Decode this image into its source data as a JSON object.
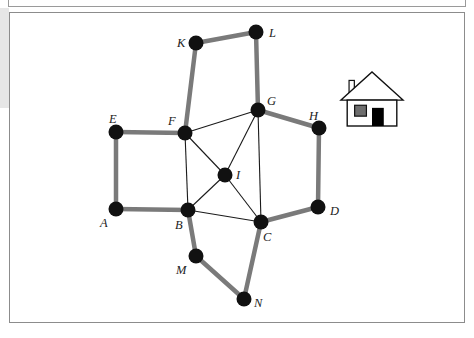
{
  "figure": {
    "background_color": "#ffffff",
    "frame_border_color": "#8c8c8c",
    "node_color": "#111111",
    "thick_edge_color": "#7a7a7a",
    "thin_edge_color": "#1a1a1a",
    "node_radius": 7.5,
    "thick_edge_width": 4.5,
    "thin_edge_width": 1.1
  },
  "graph": {
    "nodes": [
      {
        "id": "A",
        "label": "A",
        "x": 116,
        "y": 209,
        "label_x": 100,
        "label_y": 217
      },
      {
        "id": "B",
        "label": "B",
        "x": 188,
        "y": 210,
        "label_x": 175,
        "label_y": 219
      },
      {
        "id": "C",
        "label": "C",
        "x": 261,
        "y": 222,
        "label_x": 263,
        "label_y": 231
      },
      {
        "id": "D",
        "label": "D",
        "x": 318,
        "y": 207,
        "label_x": 330,
        "label_y": 205
      },
      {
        "id": "E",
        "label": "E",
        "x": 116,
        "y": 132,
        "label_x": 109,
        "label_y": 113
      },
      {
        "id": "F",
        "label": "F",
        "x": 185,
        "y": 133,
        "label_x": 168,
        "label_y": 115
      },
      {
        "id": "G",
        "label": "G",
        "x": 258,
        "y": 110,
        "label_x": 267,
        "label_y": 95
      },
      {
        "id": "H",
        "label": "H",
        "x": 319,
        "y": 128,
        "label_x": 309,
        "label_y": 110
      },
      {
        "id": "I",
        "label": "I",
        "x": 225,
        "y": 175,
        "label_x": 236,
        "label_y": 169
      },
      {
        "id": "K",
        "label": "K",
        "x": 196,
        "y": 43,
        "label_x": 177,
        "label_y": 37
      },
      {
        "id": "L",
        "label": "L",
        "x": 256,
        "y": 32,
        "label_x": 269,
        "label_y": 27
      },
      {
        "id": "M",
        "label": "M",
        "x": 196,
        "y": 256,
        "label_x": 176,
        "label_y": 264
      },
      {
        "id": "N",
        "label": "N",
        "x": 244,
        "y": 299,
        "label_x": 254,
        "label_y": 297
      }
    ],
    "edges_thick": [
      {
        "from": "E",
        "to": "F"
      },
      {
        "from": "E",
        "to": "A"
      },
      {
        "from": "A",
        "to": "B"
      },
      {
        "from": "F",
        "to": "K"
      },
      {
        "from": "K",
        "to": "L"
      },
      {
        "from": "L",
        "to": "G"
      },
      {
        "from": "G",
        "to": "H"
      },
      {
        "from": "H",
        "to": "D"
      },
      {
        "from": "D",
        "to": "C"
      },
      {
        "from": "B",
        "to": "M"
      },
      {
        "from": "M",
        "to": "N"
      },
      {
        "from": "N",
        "to": "C"
      }
    ],
    "edges_thin": [
      {
        "from": "F",
        "to": "G"
      },
      {
        "from": "F",
        "to": "I"
      },
      {
        "from": "F",
        "to": "B"
      },
      {
        "from": "G",
        "to": "I"
      },
      {
        "from": "G",
        "to": "C"
      },
      {
        "from": "I",
        "to": "B"
      },
      {
        "from": "I",
        "to": "C"
      },
      {
        "from": "B",
        "to": "C"
      }
    ]
  },
  "house_icon": {
    "name": "house-icon",
    "x": 341,
    "y": 72,
    "width": 62,
    "height": 54,
    "outline_color": "#111111",
    "wall_fill": "#ffffff",
    "window_fill": "#6e6e6e",
    "door_fill": "#000000"
  }
}
